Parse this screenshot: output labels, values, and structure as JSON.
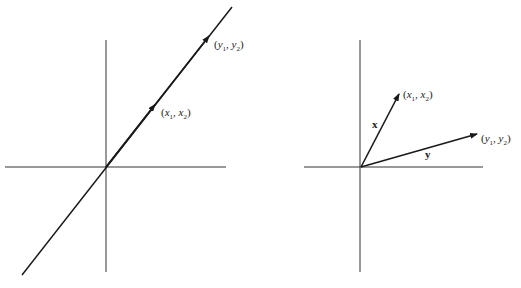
{
  "left_panel": {
    "description": "Collinear vectors on a line through the origin",
    "labels": {
      "x_point": {
        "open": "(",
        "v1": "x",
        "s1": "1",
        "sep": ", ",
        "v2": "x",
        "s2": "2",
        "close": ")"
      },
      "y_point": {
        "open": "(",
        "v1": "y",
        "s1": "1",
        "sep": ", ",
        "v2": "y",
        "s2": "2",
        "close": ")"
      }
    }
  },
  "right_panel": {
    "description": "Two vectors x and y from the origin",
    "vector_labels": {
      "x": "x",
      "y": "y"
    },
    "labels": {
      "x_point": {
        "open": "(",
        "v1": "x",
        "s1": "1",
        "sep": ", ",
        "v2": "x",
        "s2": "2",
        "close": ")"
      },
      "y_point": {
        "open": "(",
        "v1": "y",
        "s1": "1",
        "sep": ", ",
        "v2": "y",
        "s2": "2",
        "close": ")"
      }
    }
  },
  "colors": {
    "stroke": "#1a1a1a",
    "axis": "#333333",
    "background": "#ffffff"
  }
}
